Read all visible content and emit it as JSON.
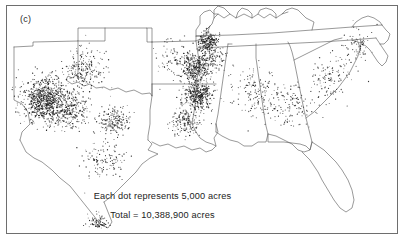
{
  "figure": {
    "panel_label": "(c)",
    "caption_line1": "Each dot represents 5,000 acres",
    "caption_line2": "Total =  10,388,900  acres"
  },
  "chart_data": {
    "type": "scatter",
    "title": "",
    "subtitle": "",
    "xlabel": "",
    "ylabel": "",
    "grid": false,
    "legend_position": "none",
    "map_projection": "conic",
    "map_region": "Southern United States (Cotton Belt)",
    "dot_value": 5000,
    "dot_unit": "acres",
    "total_value": 10388900,
    "total_unit": "acres",
    "annotations": [
      "(c)",
      "Each dot represents 5,000 acres",
      "Total =  10,388,900  acres"
    ],
    "colors": {
      "dot": "#1a1a1a",
      "state_outline": "#555555",
      "frame": "#6e6e6e",
      "background": "#ffffff"
    },
    "clusters": [
      {
        "name": "Texas High Plains",
        "x": 45,
        "y": 100,
        "density": "very-high",
        "radius": 22,
        "count": 900
      },
      {
        "name": "Texas Rolling Plains",
        "x": 72,
        "y": 112,
        "density": "medium",
        "radius": 16,
        "count": 210
      },
      {
        "name": "Texas Blackland Prairie",
        "x": 113,
        "y": 120,
        "density": "medium",
        "radius": 14,
        "count": 200
      },
      {
        "name": "Oklahoma Southwest",
        "x": 85,
        "y": 70,
        "density": "medium",
        "radius": 20,
        "count": 220
      },
      {
        "name": "Texas Coastal Bend",
        "x": 104,
        "y": 160,
        "density": "low",
        "radius": 18,
        "count": 130
      },
      {
        "name": "Rio Grande Valley",
        "x": 98,
        "y": 222,
        "density": "medium",
        "radius": 9,
        "count": 90
      },
      {
        "name": "Missouri Bootheel",
        "x": 208,
        "y": 42,
        "density": "high",
        "radius": 9,
        "count": 220
      },
      {
        "name": "Mississippi Delta North",
        "x": 197,
        "y": 68,
        "density": "high",
        "radius": 13,
        "count": 330
      },
      {
        "name": "Mississippi Delta South",
        "x": 198,
        "y": 95,
        "density": "very-high",
        "radius": 13,
        "count": 400
      },
      {
        "name": "Louisiana Delta",
        "x": 186,
        "y": 122,
        "density": "medium",
        "radius": 14,
        "count": 180
      },
      {
        "name": "Arkansas Uplands",
        "x": 176,
        "y": 60,
        "density": "low",
        "radius": 20,
        "count": 120
      },
      {
        "name": "Alabama Black Belt",
        "x": 255,
        "y": 92,
        "density": "low",
        "radius": 24,
        "count": 150
      },
      {
        "name": "Georgia Coastal Plain",
        "x": 292,
        "y": 105,
        "density": "low",
        "radius": 24,
        "count": 140
      },
      {
        "name": "South Carolina",
        "x": 330,
        "y": 78,
        "density": "low",
        "radius": 20,
        "count": 110
      },
      {
        "name": "North Carolina Coastal",
        "x": 355,
        "y": 48,
        "density": "low",
        "radius": 18,
        "count": 80
      },
      {
        "name": "Tennessee West",
        "x": 212,
        "y": 58,
        "density": "medium",
        "radius": 12,
        "count": 120
      }
    ]
  }
}
